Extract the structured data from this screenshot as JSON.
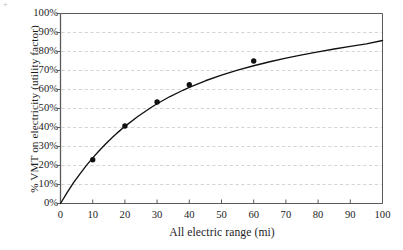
{
  "figure": {
    "artifact_mark": "+"
  },
  "chart_data": {
    "type": "scatter",
    "title": "",
    "xlabel": "All electric range (mi)",
    "ylabel": "% VMT on electricity (utility factor)",
    "xlim": [
      0,
      100
    ],
    "ylim": [
      0,
      100
    ],
    "grid": "horizontal-dashed",
    "legend": "none",
    "x_ticks": [
      0,
      10,
      20,
      30,
      40,
      50,
      60,
      70,
      80,
      90,
      100
    ],
    "x_tick_labels": [
      "0",
      "10",
      "20",
      "30",
      "40",
      "50",
      "60",
      "70",
      "80",
      "90",
      "100"
    ],
    "y_ticks": [
      0,
      10,
      20,
      30,
      40,
      50,
      60,
      70,
      80,
      90,
      100
    ],
    "y_tick_labels": [
      "0%",
      "10%",
      "20%",
      "30%",
      "40%",
      "50%",
      "60%",
      "70%",
      "80%",
      "90%",
      "100%"
    ],
    "series": [
      {
        "name": "Observed utility factor",
        "type": "scatter",
        "marker": "filled-circle",
        "color": "#111111",
        "points": [
          {
            "x": 10,
            "y": 23.0
          },
          {
            "x": 20,
            "y": 40.8
          },
          {
            "x": 30,
            "y": 53.4
          },
          {
            "x": 40,
            "y": 62.5
          },
          {
            "x": 60,
            "y": 75.0
          }
        ]
      },
      {
        "name": "Fitted utility factor curve",
        "type": "line",
        "color": "#111111",
        "points": [
          {
            "x": 0,
            "y": 0.0
          },
          {
            "x": 2,
            "y": 5.6
          },
          {
            "x": 4,
            "y": 10.8
          },
          {
            "x": 6,
            "y": 15.5
          },
          {
            "x": 8,
            "y": 19.9
          },
          {
            "x": 10,
            "y": 24.0
          },
          {
            "x": 12,
            "y": 27.8
          },
          {
            "x": 14,
            "y": 31.3
          },
          {
            "x": 16,
            "y": 34.6
          },
          {
            "x": 18,
            "y": 37.7
          },
          {
            "x": 20,
            "y": 40.6
          },
          {
            "x": 24,
            "y": 45.8
          },
          {
            "x": 28,
            "y": 50.4
          },
          {
            "x": 30,
            "y": 52.5
          },
          {
            "x": 34,
            "y": 56.3
          },
          {
            "x": 38,
            "y": 59.6
          },
          {
            "x": 40,
            "y": 61.1
          },
          {
            "x": 45,
            "y": 64.6
          },
          {
            "x": 50,
            "y": 67.6
          },
          {
            "x": 55,
            "y": 70.2
          },
          {
            "x": 60,
            "y": 72.5
          },
          {
            "x": 65,
            "y": 74.6
          },
          {
            "x": 70,
            "y": 76.5
          },
          {
            "x": 75,
            "y": 78.2
          },
          {
            "x": 80,
            "y": 79.8
          },
          {
            "x": 85,
            "y": 81.3
          },
          {
            "x": 90,
            "y": 82.7
          },
          {
            "x": 95,
            "y": 84.0
          },
          {
            "x": 100,
            "y": 85.8
          }
        ]
      }
    ]
  },
  "style": {
    "axis_color": "#5a5a5a",
    "grid_color": "#c9c9c9",
    "data_color": "#111111",
    "text_color": "#1d1d1d",
    "background": "#ffffff"
  }
}
